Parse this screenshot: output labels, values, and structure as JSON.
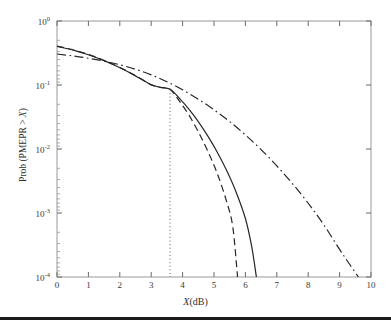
{
  "chart_data": {
    "type": "line",
    "title": "",
    "xlabel": "X(dB)",
    "ylabel": "Prob (PMEPR > X)",
    "xlim": [
      0,
      10
    ],
    "ylim": [
      0.0001,
      1
    ],
    "yscale": "log",
    "xscale": "linear",
    "grid": false,
    "legend": "none",
    "xticks": [
      "0",
      "1",
      "2",
      "3",
      "4",
      "5",
      "6",
      "7",
      "8",
      "9",
      "10"
    ],
    "xtick_values": [
      0,
      1,
      2,
      3,
      4,
      5,
      6,
      7,
      8,
      9,
      10
    ],
    "ytick_labels": [
      "10",
      "10",
      "10",
      "10",
      "10"
    ],
    "ytick_exponents": [
      "0",
      "-1",
      "-2",
      "-3",
      "-4"
    ],
    "ytick_values": [
      1,
      0.1,
      0.01,
      0.001,
      0.0001
    ],
    "series": [
      {
        "name": "solid-curve",
        "style": "solid",
        "color": "#262626",
        "x": [
          0.0,
          0.3,
          0.6,
          0.9,
          1.2,
          1.5,
          1.8,
          2.1,
          2.4,
          2.7,
          3.0,
          3.3,
          3.6,
          3.9,
          4.2,
          4.5,
          4.8,
          5.1,
          5.4,
          5.7,
          6.0,
          6.2,
          6.35
        ],
        "y": [
          0.4,
          0.372,
          0.341,
          0.308,
          0.274,
          0.24,
          0.207,
          0.176,
          0.148,
          0.122,
          0.1005,
          0.0915,
          0.0855,
          0.062,
          0.042,
          0.0268,
          0.016,
          0.009,
          0.00465,
          0.00215,
          0.00082,
          0.0003,
          0.0001
        ]
      },
      {
        "name": "dashed-curve",
        "style": "dashed",
        "color": "#262626",
        "x": [
          0.0,
          0.3,
          0.6,
          0.9,
          1.2,
          1.5,
          1.8,
          2.1,
          2.4,
          2.7,
          3.0,
          3.3,
          3.6,
          3.9,
          4.2,
          4.5,
          4.8,
          5.1,
          5.4,
          5.6,
          5.75
        ],
        "y": [
          0.405,
          0.376,
          0.345,
          0.312,
          0.277,
          0.242,
          0.209,
          0.178,
          0.149,
          0.123,
          0.101,
          0.092,
          0.0855,
          0.056,
          0.034,
          0.0186,
          0.0093,
          0.0042,
          0.00152,
          0.0006,
          0.0001
        ]
      },
      {
        "name": "dash-dot-curve",
        "style": "dashdot",
        "color": "#262626",
        "x": [
          0.0,
          0.5,
          1.0,
          1.5,
          2.0,
          2.5,
          3.0,
          3.5,
          4.0,
          4.5,
          5.0,
          5.5,
          6.0,
          6.5,
          7.0,
          7.5,
          8.0,
          8.5,
          9.0,
          9.35,
          9.6
        ],
        "y": [
          0.305,
          0.285,
          0.262,
          0.236,
          0.207,
          0.176,
          0.144,
          0.1125,
          0.084,
          0.06,
          0.041,
          0.0268,
          0.0166,
          0.0098,
          0.00545,
          0.00287,
          0.00142,
          0.00065,
          0.00027,
          0.00015,
          0.0001
        ]
      },
      {
        "name": "vertical-marker",
        "style": "dotted",
        "color": "#5a5a5a",
        "x": [
          3.6,
          3.6
        ],
        "y": [
          0.0855,
          0.0001
        ],
        "annotation": "vertical dotted line at X = 3.6 dB dropping from the curve intersection at Prob ~ 0.085 down to 10^-4"
      }
    ]
  },
  "axes": {
    "x_axis_label": "X(dB)",
    "x_axis_label_italic_part": "X",
    "x_axis_label_plain_part": "(dB)",
    "y_axis_label_prefix": "Prob (PMEPR > ",
    "y_axis_label_italic": "X",
    "y_axis_label_suffix": ")",
    "frame_color": "#9a9a9a",
    "tick_color": "#6a6a6a"
  },
  "figure": {
    "background": "#ffffff",
    "bottom_rule_color": "#1a1a1a"
  }
}
